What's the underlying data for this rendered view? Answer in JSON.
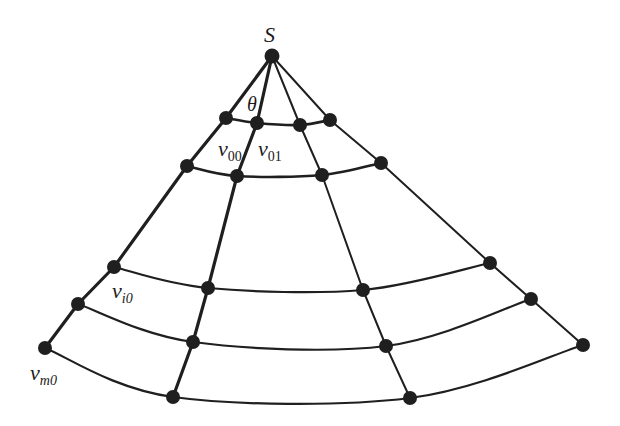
{
  "diagram": {
    "title": "",
    "type": "sector-mesh",
    "colors": {
      "line": "#1f1f1f",
      "node": "#1f1f1f",
      "background": "#ffffff"
    },
    "apex": {
      "id": "S",
      "label": "S",
      "x": 272,
      "y": 56
    },
    "angle_label": {
      "text": "θ",
      "x": 247,
      "y": 98
    },
    "radials": [
      {
        "id": "r0",
        "nodes": [
          [
            226,
            118
          ],
          [
            187,
            166
          ],
          [
            114,
            267
          ],
          [
            78,
            304
          ],
          [
            45,
            348
          ]
        ],
        "weight": "bold"
      },
      {
        "id": "r1",
        "nodes": [
          [
            257,
            123
          ],
          [
            237,
            176
          ],
          [
            208,
            288
          ],
          [
            193,
            342
          ],
          [
            173,
            397
          ]
        ],
        "weight": "bold"
      },
      {
        "id": "r2",
        "nodes": [
          [
            300,
            125
          ],
          [
            322,
            175
          ],
          [
            363,
            290
          ],
          [
            386,
            346
          ],
          [
            410,
            398
          ]
        ],
        "weight": "normal"
      },
      {
        "id": "r3",
        "nodes": [
          [
            330,
            120
          ],
          [
            381,
            163
          ],
          [
            490,
            263
          ],
          [
            531,
            299
          ],
          [
            583,
            345
          ]
        ],
        "weight": "normal"
      }
    ],
    "rings": 5,
    "labels": [
      {
        "id": "v00",
        "base": "v",
        "sub": "00",
        "x": 218,
        "y": 142
      },
      {
        "id": "v01",
        "base": "v",
        "sub": "01",
        "x": 258,
        "y": 142
      },
      {
        "id": "vi0",
        "base": "v",
        "sub": "i0",
        "x": 112,
        "y": 285
      },
      {
        "id": "vm0",
        "base": "v",
        "sub": "m0",
        "x": 30,
        "y": 366
      }
    ]
  }
}
